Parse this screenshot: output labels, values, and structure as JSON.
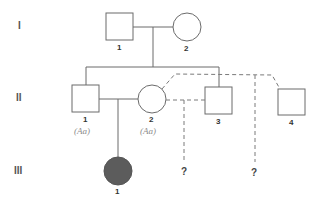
{
  "diagram": {
    "type": "pedigree",
    "colors": {
      "line": "#6b6b6b",
      "affected_fill": "#5c5c5c",
      "genotype_text": "#8a8a8a"
    },
    "generations": [
      {
        "label": "I"
      },
      {
        "label": "II"
      },
      {
        "label": "III"
      }
    ],
    "individuals": {
      "I_1": {
        "number": "1",
        "sex": "male",
        "affected": false
      },
      "I_2": {
        "number": "2",
        "sex": "female",
        "affected": false
      },
      "II_1": {
        "number": "1",
        "sex": "male",
        "affected": false,
        "genotype": "(Aa)"
      },
      "II_2": {
        "number": "2",
        "sex": "female",
        "affected": false,
        "genotype": "(Aa)"
      },
      "II_3": {
        "number": "3",
        "sex": "male",
        "affected": false
      },
      "II_4": {
        "number": "4",
        "sex": "male",
        "affected": false
      },
      "III_1": {
        "number": "1",
        "sex": "female",
        "affected": true
      }
    },
    "hypothetical_offspring": [
      {
        "parents": "II-2 × II-3",
        "label": "?"
      },
      {
        "parents": "II-2 × II-4",
        "label": "?"
      }
    ]
  }
}
